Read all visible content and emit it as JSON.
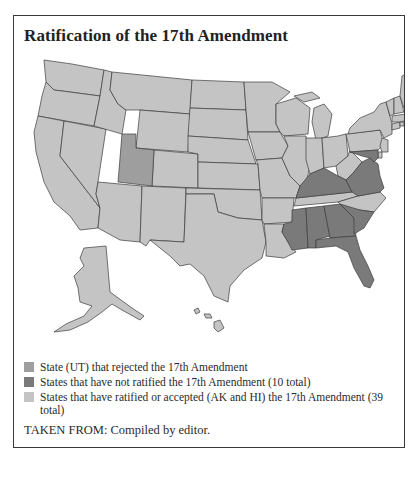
{
  "figure": {
    "title": "Ratification of the 17th Amendment",
    "source": "TAKEN FROM: Compiled by editor."
  },
  "colors": {
    "rejected": "#9e9e9e",
    "not_ratified": "#7a7a7a",
    "ratified": "#c4c4c4",
    "border": "#3c3c3c"
  },
  "legend": {
    "items": [
      {
        "key": "rejected",
        "label": "State (UT) that rejected the 17th Amendment"
      },
      {
        "key": "not_ratified",
        "label": "States that have not ratified the 17th Amendment (10 total)"
      },
      {
        "key": "ratified",
        "label": "States that have ratified or accepted (AK and HI) the 17th Amendment (39 total)"
      }
    ]
  },
  "map": {
    "rejected_states": [
      "UT"
    ],
    "not_ratified_states_visible": [
      "MS",
      "AL",
      "GA",
      "SC",
      "FL",
      "KY",
      "VA",
      "MD"
    ],
    "accepted_states": [
      "AK",
      "HI"
    ]
  }
}
